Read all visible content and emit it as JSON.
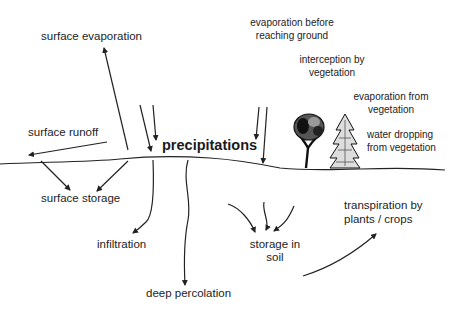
{
  "diagram": {
    "labels": {
      "surface_evaporation": "surface evaporation",
      "surface_runoff": "surface runoff",
      "precipitations": "precipitations",
      "evaporation_before_1": "evaporation before",
      "evaporation_before_2": "reaching ground",
      "interception_1": "interception by",
      "interception_2": "vegetation",
      "evap_veg_1": "evaporation from",
      "evap_veg_2": "vegetation",
      "water_drop_1": "water dropping",
      "water_drop_2": "from vegetation",
      "surface_storage": "surface storage",
      "infiltration": "infiltration",
      "deep_percolation": "deep percolation",
      "storage_soil_1": "storage in",
      "storage_soil_2": "soil",
      "transpiration_1": "transpiration by",
      "transpiration_2": "plants / crops"
    },
    "colors": {
      "line": "#222222",
      "background": "#ffffff"
    }
  }
}
